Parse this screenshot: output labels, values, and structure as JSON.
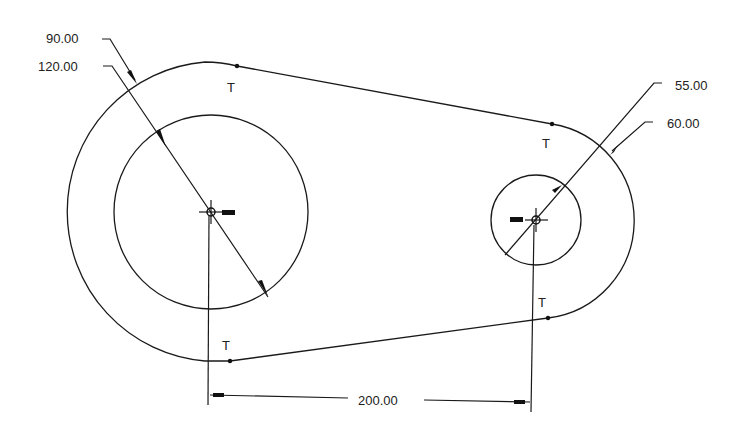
{
  "drawing": {
    "type": "2D sketch - linkage arm with two bosses",
    "line_color": "#1a1a1a",
    "background": "#ffffff",
    "dimensions": [
      {
        "id": "dim-outer-left",
        "label": "90.00",
        "kind": "radius",
        "applies_to": "left outer arc"
      },
      {
        "id": "dim-inner-left",
        "label": "120.00",
        "kind": "diameter",
        "applies_to": "left inner circle"
      },
      {
        "id": "dim-inner-right",
        "label": "55.00",
        "kind": "diameter",
        "applies_to": "right inner circle"
      },
      {
        "id": "dim-outer-right",
        "label": "60.00",
        "kind": "radius",
        "applies_to": "right outer arc"
      },
      {
        "id": "dim-center-distance",
        "label": "200.00",
        "kind": "linear",
        "applies_to": "distance between centers"
      }
    ],
    "constraints": [
      {
        "label": "T",
        "meaning": "tangent",
        "location": "top-left"
      },
      {
        "label": "T",
        "meaning": "tangent",
        "location": "top-right"
      },
      {
        "label": "T",
        "meaning": "tangent",
        "location": "bottom-left"
      },
      {
        "label": "T",
        "meaning": "tangent",
        "location": "bottom-right"
      }
    ]
  }
}
